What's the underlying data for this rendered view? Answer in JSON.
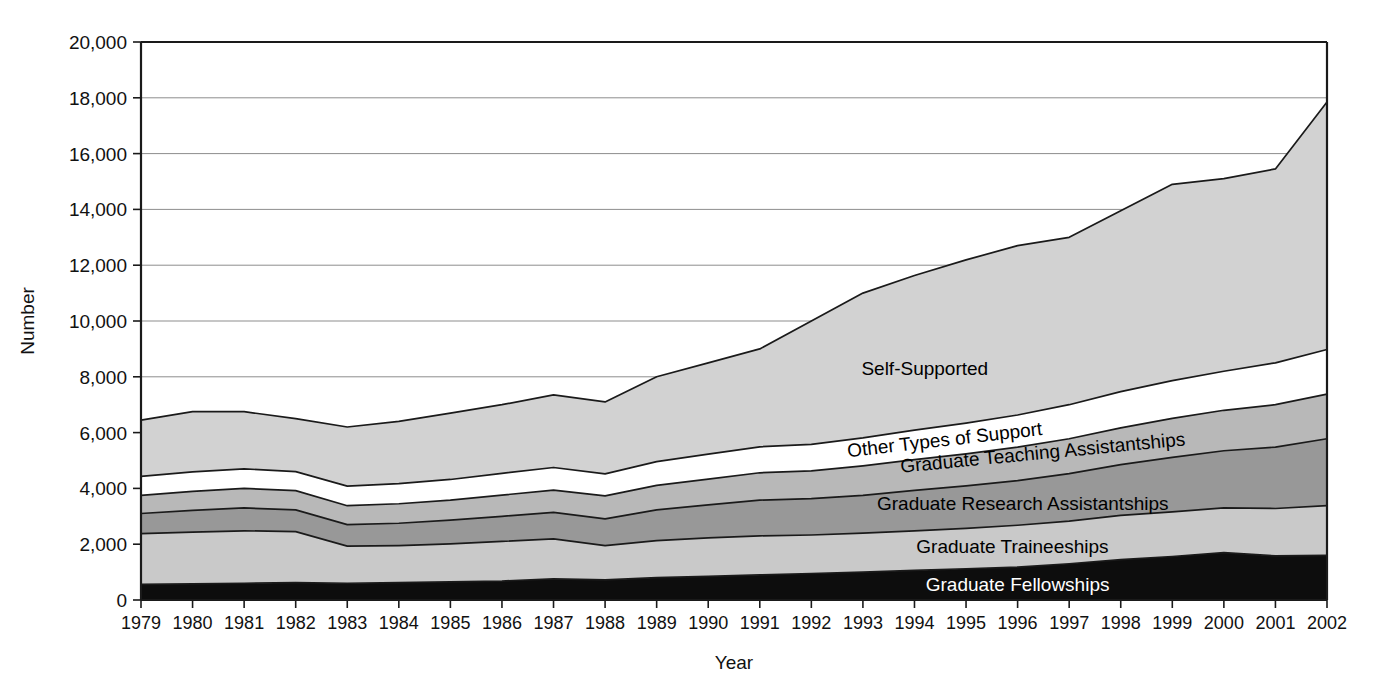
{
  "chart_data": {
    "type": "area",
    "stacked": true,
    "title": "",
    "xlabel": "Year",
    "ylabel": "Number",
    "grid": true,
    "legend_position": "inline-labels",
    "xlim": [
      1979,
      2002
    ],
    "ylim": [
      0,
      20000
    ],
    "ytick_step": 2000,
    "ytick_labels": [
      "0",
      "2,000",
      "4,000",
      "6,000",
      "8,000",
      "10,000",
      "12,000",
      "14,000",
      "16,000",
      "18,000",
      "20,000"
    ],
    "ytick_values": [
      0,
      2000,
      4000,
      6000,
      8000,
      10000,
      12000,
      14000,
      16000,
      18000,
      20000
    ],
    "categories": [
      1979,
      1980,
      1981,
      1982,
      1983,
      1984,
      1985,
      1986,
      1987,
      1988,
      1989,
      1990,
      1991,
      1992,
      1993,
      1994,
      1995,
      1996,
      1997,
      1998,
      1999,
      2000,
      2001,
      2002
    ],
    "xtick_labels": [
      "1979",
      "1980",
      "1981",
      "1982",
      "1983",
      "1984",
      "1985",
      "1986",
      "1987",
      "1988",
      "1989",
      "1990",
      "1991",
      "1992",
      "1993",
      "1994",
      "1995",
      "1996",
      "1997",
      "1998",
      "1999",
      "2000",
      "2001",
      "2002"
    ],
    "series": [
      {
        "name": "Graduate Fellowships",
        "color": "#0d0d0d",
        "label_color": "#ffffff",
        "values": [
          560,
          580,
          600,
          620,
          600,
          620,
          650,
          680,
          760,
          720,
          800,
          850,
          900,
          950,
          1000,
          1060,
          1120,
          1180,
          1300,
          1450,
          1560,
          1700,
          1580,
          1600
        ]
      },
      {
        "name": "Graduate Traineeships",
        "color": "#c9c9c9",
        "label_color": "#000000",
        "values": [
          1820,
          1850,
          1880,
          1830,
          1330,
          1330,
          1360,
          1420,
          1430,
          1230,
          1330,
          1380,
          1400,
          1380,
          1400,
          1420,
          1450,
          1500,
          1530,
          1580,
          1600,
          1600,
          1700,
          1780
        ]
      },
      {
        "name": "Graduate Research Assistantships",
        "color": "#989898",
        "label_color": "#000000",
        "values": [
          720,
          780,
          820,
          780,
          770,
          800,
          850,
          900,
          950,
          960,
          1100,
          1180,
          1280,
          1300,
          1350,
          1450,
          1520,
          1600,
          1700,
          1820,
          1950,
          2050,
          2200,
          2400
        ]
      },
      {
        "name": "Graduate Teaching Assistantships",
        "color": "#b8b8b8",
        "label_color": "#000000",
        "values": [
          650,
          680,
          700,
          690,
          680,
          700,
          720,
          760,
          800,
          820,
          880,
          920,
          980,
          1000,
          1060,
          1100,
          1150,
          1200,
          1250,
          1320,
          1400,
          1450,
          1520,
          1600
        ]
      },
      {
        "name": "Other Types of Support",
        "color": "#ffffff",
        "label_color": "#000000",
        "values": [
          680,
          700,
          700,
          680,
          700,
          720,
          740,
          780,
          810,
          790,
          850,
          900,
          930,
          950,
          1000,
          1060,
          1100,
          1150,
          1220,
          1300,
          1350,
          1400,
          1500,
          1600
        ]
      },
      {
        "name": "Self-Supported",
        "color": "#d2d2d2",
        "label_color": "#000000",
        "values": [
          2020,
          2160,
          2050,
          1900,
          2120,
          2230,
          2380,
          2460,
          2600,
          2580,
          3040,
          3270,
          3510,
          4420,
          5190,
          5540,
          5850,
          6070,
          6000,
          6480,
          7040,
          6900,
          6950,
          8870
        ]
      }
    ],
    "totals": [
      6450,
      6750,
      6750,
      6500,
      6200,
      6400,
      6700,
      7000,
      7350,
      7100,
      8000,
      8500,
      9000,
      10000,
      11000,
      11630,
      12190,
      12700,
      13000,
      13950,
      14900,
      15100,
      15450,
      17850
    ]
  }
}
